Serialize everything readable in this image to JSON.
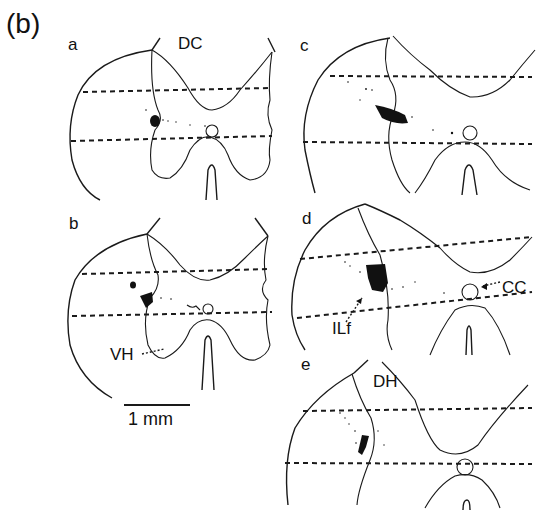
{
  "figure": {
    "panel_label": "(b)",
    "scale_bar": {
      "label": "1 mm"
    },
    "panels": [
      {
        "id": "a",
        "label": "a",
        "annotations": [
          "DC"
        ]
      },
      {
        "id": "b",
        "label": "b",
        "annotations": [
          "VH"
        ]
      },
      {
        "id": "c",
        "label": "c",
        "annotations": []
      },
      {
        "id": "d",
        "label": "d",
        "annotations": [
          "ILf",
          "CC"
        ]
      },
      {
        "id": "e",
        "label": "e",
        "annotations": [
          "DH"
        ]
      }
    ]
  },
  "labels": {
    "panel_tag": "(b)",
    "a": "a",
    "b": "b",
    "c": "c",
    "d": "d",
    "e": "e",
    "dc": "DC",
    "vh": "VH",
    "ilf": "ILf",
    "cc": "CC",
    "dh": "DH",
    "scale": "1 mm"
  },
  "colors": {
    "ink": "#1a1a1a",
    "background": "#ffffff"
  }
}
